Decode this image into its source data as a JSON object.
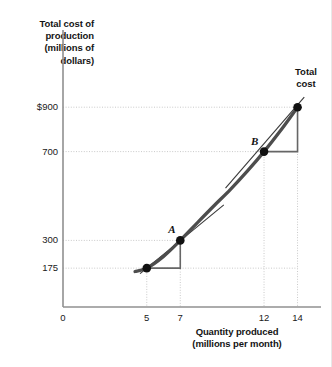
{
  "chart_data": {
    "type": "line",
    "title": "",
    "ylabel": "Total cost of\nproduction\n(millions of\ndollars)",
    "xlabel": "Quantity produced\n(millions per month)",
    "xlim": [
      0,
      15.4
    ],
    "ylim": [
      0,
      1000
    ],
    "grid": true,
    "legend_position": "none",
    "x_ticks": [
      {
        "value": 0,
        "label": "0"
      },
      {
        "value": 5,
        "label": "5"
      },
      {
        "value": 7,
        "label": "7"
      },
      {
        "value": 12,
        "label": "12"
      },
      {
        "value": 14,
        "label": "14"
      }
    ],
    "y_ticks": [
      {
        "value": 175,
        "label": "175"
      },
      {
        "value": 300,
        "label": "300"
      },
      {
        "value": 700,
        "label": "700"
      },
      {
        "value": 900,
        "label": "$900"
      }
    ],
    "series": [
      {
        "name": "Total cost",
        "label": "Total\ncost",
        "color": "#4d4d4d",
        "x": [
          4.3,
          5,
          6,
          7,
          8,
          9,
          10,
          11,
          12,
          13,
          14
        ],
        "y": [
          160,
          175,
          228,
          300,
          378,
          455,
          530,
          612,
          700,
          796,
          900
        ]
      }
    ],
    "annotated_points": [
      {
        "label": "A",
        "x": 7,
        "y": 300
      },
      {
        "label": "B",
        "x": 12,
        "y": 700
      }
    ],
    "plain_points": [
      {
        "x": 5,
        "y": 175
      },
      {
        "x": 14,
        "y": 900
      }
    ],
    "slope_triangles": [
      {
        "from": {
          "x": 5,
          "y": 175
        },
        "to": {
          "x": 7,
          "y": 300
        }
      },
      {
        "from": {
          "x": 12,
          "y": 700
        },
        "to": {
          "x": 14,
          "y": 900
        }
      }
    ],
    "tangents": [
      {
        "at_point": "A",
        "x0": 4.6,
        "y0": 150,
        "x1": 9.6,
        "y1": 460
      },
      {
        "at_point": "B",
        "x0": 9.7,
        "y0": 535,
        "x1": 14.4,
        "y1": 945
      }
    ]
  },
  "colors": {
    "curve": "#4d4d4d",
    "axis": "#909090",
    "gridline": "#c9c9c9",
    "marker": "#111111",
    "triangle": "#666666",
    "text": "#141414"
  }
}
